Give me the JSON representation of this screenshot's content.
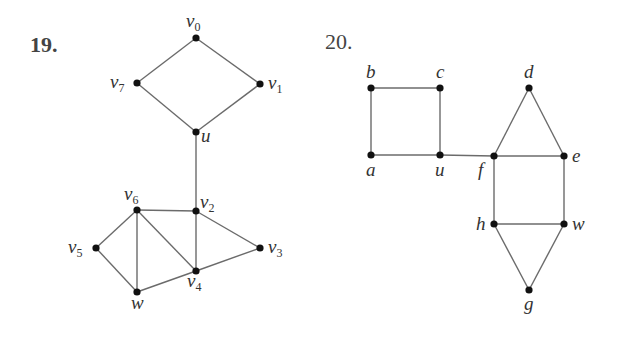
{
  "problems": [
    {
      "number": "19.",
      "vertices": [
        {
          "id": "v0",
          "base": "v",
          "sub": "0",
          "x": 196,
          "y": 38
        },
        {
          "id": "v1",
          "base": "v",
          "sub": "1",
          "x": 260,
          "y": 84
        },
        {
          "id": "v7",
          "base": "v",
          "sub": "7",
          "x": 137,
          "y": 83
        },
        {
          "id": "u",
          "base": "u",
          "sub": "",
          "x": 196,
          "y": 132
        },
        {
          "id": "v2",
          "base": "v",
          "sub": "2",
          "x": 196,
          "y": 211
        },
        {
          "id": "v6",
          "base": "v",
          "sub": "6",
          "x": 137,
          "y": 210
        },
        {
          "id": "v5",
          "base": "v",
          "sub": "5",
          "x": 96,
          "y": 248
        },
        {
          "id": "v3",
          "base": "v",
          "sub": "3",
          "x": 260,
          "y": 248
        },
        {
          "id": "v4",
          "base": "v",
          "sub": "4",
          "x": 196,
          "y": 271
        },
        {
          "id": "w",
          "base": "w",
          "sub": "",
          "x": 137,
          "y": 292
        }
      ],
      "edges": [
        [
          "v0",
          "v7"
        ],
        [
          "v0",
          "v1"
        ],
        [
          "v7",
          "u"
        ],
        [
          "v1",
          "u"
        ],
        [
          "u",
          "v2"
        ],
        [
          "v6",
          "v2"
        ],
        [
          "v6",
          "v5"
        ],
        [
          "v6",
          "w"
        ],
        [
          "v6",
          "v4"
        ],
        [
          "v2",
          "v4"
        ],
        [
          "v2",
          "v3"
        ],
        [
          "v5",
          "w"
        ],
        [
          "w",
          "v4"
        ],
        [
          "v4",
          "v3"
        ]
      ]
    },
    {
      "number": "20.",
      "vertices": [
        {
          "id": "b",
          "x": 371,
          "y": 88
        },
        {
          "id": "c",
          "x": 440,
          "y": 88
        },
        {
          "id": "a",
          "x": 371,
          "y": 155
        },
        {
          "id": "u",
          "x": 440,
          "y": 155
        },
        {
          "id": "f",
          "x": 494,
          "y": 156
        },
        {
          "id": "e",
          "x": 564,
          "y": 156
        },
        {
          "id": "d",
          "x": 529,
          "y": 88
        },
        {
          "id": "h",
          "x": 494,
          "y": 224
        },
        {
          "id": "w",
          "x": 564,
          "y": 224
        },
        {
          "id": "g",
          "x": 529,
          "y": 290
        }
      ],
      "edges": [
        [
          "b",
          "c"
        ],
        [
          "b",
          "a"
        ],
        [
          "c",
          "u"
        ],
        [
          "a",
          "u"
        ],
        [
          "u",
          "f"
        ],
        [
          "f",
          "e"
        ],
        [
          "f",
          "d"
        ],
        [
          "d",
          "e"
        ],
        [
          "f",
          "h"
        ],
        [
          "e",
          "w"
        ],
        [
          "h",
          "w"
        ],
        [
          "h",
          "g"
        ],
        [
          "w",
          "g"
        ]
      ]
    }
  ]
}
